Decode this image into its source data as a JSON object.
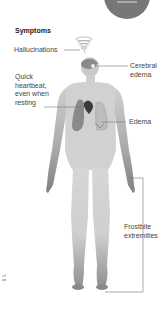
{
  "header": {
    "title": "Symptoms"
  },
  "labels": {
    "hallucinations": "Hallucinations",
    "heartbeat": [
      "Quick",
      "heartbeat,",
      "even when",
      "resting"
    ],
    "cerebral": [
      "Cerebral",
      "edema"
    ],
    "edema": "Edema",
    "frostbite": [
      "Frostbite",
      "extremities"
    ]
  },
  "footnote": [
    "s if",
    "ion."
  ],
  "colors": {
    "body_light": "#d4d4d4",
    "body_dark": "#8a8a8a",
    "organ": "#7a7a7a",
    "heart": "#3a3a3a",
    "leader_line": "#777777",
    "badge": "#777777"
  }
}
